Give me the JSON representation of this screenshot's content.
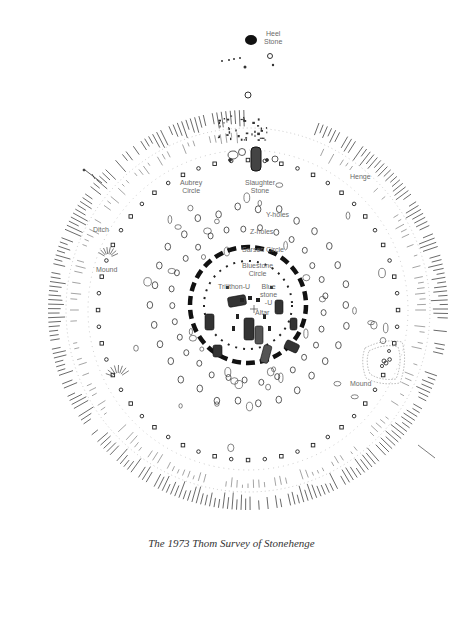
{
  "title": "The 1973 Thom Survey of Stonehenge",
  "labels": {
    "heel_stone": "Heel\nStone",
    "heel_stone_l1": "Heel",
    "heel_stone_l2": "Stone",
    "slaughter_stone_l1": "Slaughter",
    "slaughter_stone_l2": "Stone",
    "aubrey_circle_l1": "Aubrey",
    "aubrey_circle_l2": "Circle",
    "henge": "Henge",
    "ditch": "Ditch",
    "mound_west": "Mound",
    "y_holes": "Y-holes",
    "z_holes": "Z-holes",
    "sarsen_circle": "Sarsen Circle",
    "bluestone_circle_l1": "Bluestone",
    "bluestone_circle_l2": "Circle",
    "trilithon_u": "Trilithon-U",
    "bluestone_u_l1": "Blue",
    "bluestone_u_l2": "stone",
    "bluestone_u_l3": "-U",
    "altar": "Altar",
    "mound_east": "Mound"
  },
  "colors": {
    "ink": "#1a1a1a",
    "label": "#6a6a6a",
    "hatch": "#555555",
    "background": "#ffffff"
  }
}
